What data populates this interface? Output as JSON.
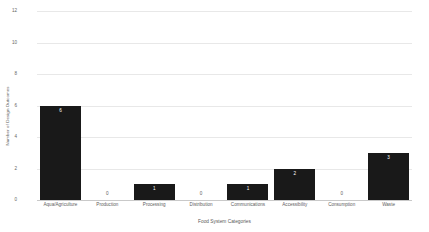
{
  "chart_data": {
    "type": "bar",
    "title": "",
    "xlabel": "Food System Categories",
    "ylabel": "Number of Design Outcomes",
    "categories": [
      "Aqua/Agriculture",
      "Production",
      "Processing",
      "Distribution",
      "Communications",
      "Accessibility",
      "Consumption",
      "Waste"
    ],
    "values": [
      6,
      0,
      1,
      0,
      1,
      2,
      0,
      3
    ],
    "value_labels": [
      "6",
      "0",
      "1",
      "0",
      "1",
      "2",
      "0",
      "3"
    ],
    "ylim": [
      0,
      12
    ],
    "yticks": [
      12,
      10,
      8,
      6,
      4,
      2,
      0
    ],
    "ytick_labels": [
      "12",
      "10",
      "8",
      "6",
      "4",
      "2",
      "0"
    ],
    "grid": true,
    "legend": false,
    "bar_color": "#191919",
    "grid_color": "#e8e8e8",
    "axis_color": "#c9c9c9",
    "label_color": "#5e5e5e",
    "value_label_inside_color": "#ffffff"
  }
}
